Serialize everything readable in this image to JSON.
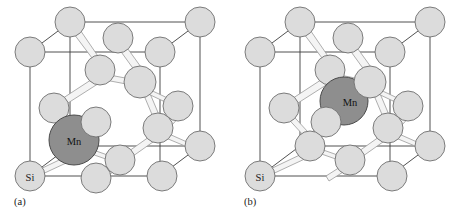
{
  "figure": {
    "type": "crystal-structure-diagram",
    "background_color": "#ffffff",
    "colors": {
      "silicon_fill": "#dcdcdc",
      "silicon_stroke": "#6e6e6e",
      "manganese_fill": "#8e8e8e",
      "manganese_stroke": "#4a4a4a",
      "bond_fill": "#f2f2f2",
      "bond_stroke": "#9a9a9a",
      "cell_edge": "#3c3c3c",
      "label_text": "#1a1a1a"
    },
    "legend_labels": {
      "silicon": "Si",
      "manganese": "Mn"
    },
    "panels": [
      {
        "id": "a",
        "caption": "(a)",
        "site": "substitutional",
        "si_label": "Si",
        "mn_label": "Mn",
        "mn_position": {
          "x": 74,
          "y": 140,
          "r": 25
        },
        "si_corner_label_position": {
          "x": 30,
          "y": 176
        }
      },
      {
        "id": "b",
        "caption": "(b)",
        "site": "interstitial",
        "si_label": "Si",
        "mn_label": "Mn",
        "mn_position": {
          "x": 114,
          "y": 101,
          "r": 24
        },
        "si_corner_label_position": {
          "x": 30,
          "y": 176
        }
      }
    ],
    "lattice": {
      "cell_corners": {
        "front_bottom_left": {
          "x": 30,
          "y": 176
        },
        "front_bottom_right": {
          "x": 160,
          "y": 176
        },
        "front_top_left": {
          "x": 30,
          "y": 52
        },
        "front_top_right": {
          "x": 160,
          "y": 52
        },
        "back_bottom_left": {
          "x": 70,
          "y": 146
        },
        "back_bottom_right": {
          "x": 200,
          "y": 146
        },
        "back_top_left": {
          "x": 70,
          "y": 22
        },
        "back_top_right": {
          "x": 200,
          "y": 22
        }
      },
      "silicon_atoms": [
        {
          "name": "corner-front-bottom-left",
          "x": 30,
          "y": 176,
          "r": 15
        },
        {
          "name": "corner-front-bottom-mid",
          "x": 96,
          "y": 178,
          "r": 15
        },
        {
          "name": "corner-front-bottom-right",
          "x": 162,
          "y": 176,
          "r": 15
        },
        {
          "name": "corner-front-top-left",
          "x": 30,
          "y": 52,
          "r": 15
        },
        {
          "name": "corner-front-top-right",
          "x": 160,
          "y": 52,
          "r": 15
        },
        {
          "name": "corner-back-top-left",
          "x": 70,
          "y": 22,
          "r": 15
        },
        {
          "name": "corner-back-top-right",
          "x": 200,
          "y": 22,
          "r": 15
        },
        {
          "name": "corner-back-bottom-right",
          "x": 200,
          "y": 146,
          "r": 15
        },
        {
          "name": "face-top-center",
          "x": 118,
          "y": 38,
          "r": 15
        },
        {
          "name": "face-left-center",
          "x": 54,
          "y": 108,
          "r": 15
        },
        {
          "name": "face-right-center",
          "x": 178,
          "y": 106,
          "r": 15
        },
        {
          "name": "face-front-center",
          "x": 96,
          "y": 122,
          "r": 15
        },
        {
          "name": "tetra-upper-left",
          "x": 100,
          "y": 70,
          "r": 15
        },
        {
          "name": "tetra-upper-right",
          "x": 140,
          "y": 82,
          "r": 16
        },
        {
          "name": "tetra-lower-right",
          "x": 158,
          "y": 128,
          "r": 15
        },
        {
          "name": "tetra-lower-mid",
          "x": 120,
          "y": 160,
          "r": 15
        }
      ]
    }
  }
}
